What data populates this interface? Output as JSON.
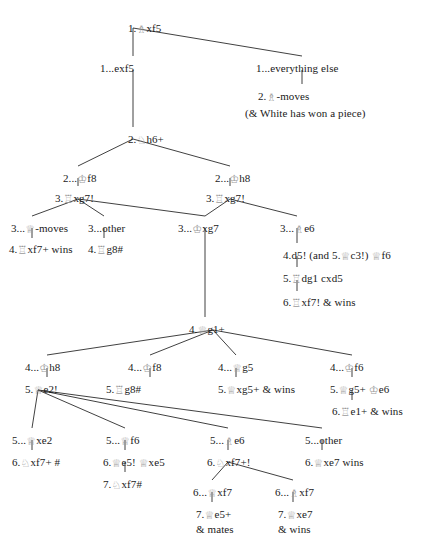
{
  "figure": {
    "type": "chess-variation-tree",
    "piece_glyph_color": "#9a9a9a",
    "line_color": "#2b2b2b",
    "background": "#ffffff"
  },
  "nodes": [
    {
      "id": "n1",
      "x": 128,
      "y": 22,
      "align": "left",
      "text": "1.♗xf5"
    },
    {
      "id": "n2",
      "x": 100,
      "y": 62,
      "align": "left",
      "text": "1...exf5"
    },
    {
      "id": "n3",
      "x": 256,
      "y": 62,
      "align": "left",
      "text": "1...everything else"
    },
    {
      "id": "n4",
      "x": 258,
      "y": 90,
      "align": "left",
      "text": "2.♗-moves"
    },
    {
      "id": "n5",
      "x": 245,
      "y": 107,
      "align": "left",
      "text": "(& White has won a piece)"
    },
    {
      "id": "n6",
      "x": 128,
      "y": 133,
      "align": "left",
      "text": "2.♘h6+"
    },
    {
      "id": "n7",
      "x": 63,
      "y": 172,
      "align": "left",
      "text": "2...♔f8"
    },
    {
      "id": "n8",
      "x": 215,
      "y": 172,
      "align": "left",
      "text": "2...♔h8"
    },
    {
      "id": "n9",
      "x": 55,
      "y": 192,
      "align": "left",
      "text": "3.♖xg7!"
    },
    {
      "id": "n10",
      "x": 206,
      "y": 192,
      "align": "left",
      "text": "3.♖xg7!"
    },
    {
      "id": "n11",
      "x": 11,
      "y": 222,
      "align": "left",
      "text": "3...♕-moves"
    },
    {
      "id": "n12",
      "x": 88,
      "y": 222,
      "align": "left",
      "text": "3...other"
    },
    {
      "id": "n13",
      "x": 178,
      "y": 222,
      "align": "left",
      "text": "3...♔xg7"
    },
    {
      "id": "n14",
      "x": 280,
      "y": 222,
      "align": "left",
      "text": "3...♗e6"
    },
    {
      "id": "n15",
      "x": 9,
      "y": 243,
      "align": "left",
      "text": "4.♖xf7+ wins"
    },
    {
      "id": "n16",
      "x": 88,
      "y": 243,
      "align": "left",
      "text": "4.♖g8#"
    },
    {
      "id": "n17",
      "x": 283,
      "y": 249,
      "align": "left",
      "text": "4.d5! (and 5.♕c3!) ♕f6"
    },
    {
      "id": "n18",
      "x": 283,
      "y": 272,
      "align": "left",
      "text": "5.♖dg1 cxd5"
    },
    {
      "id": "n19",
      "x": 283,
      "y": 296,
      "align": "left",
      "text": "6.♖xf7! & wins"
    },
    {
      "id": "n20",
      "x": 189,
      "y": 323,
      "align": "left",
      "text": "4.♕g1+"
    },
    {
      "id": "n21",
      "x": 25,
      "y": 361,
      "align": "left",
      "text": "4...♔h8"
    },
    {
      "id": "n22",
      "x": 128,
      "y": 361,
      "align": "left",
      "text": "4...♔f8"
    },
    {
      "id": "n23",
      "x": 218,
      "y": 361,
      "align": "left",
      "text": "4...♕g5"
    },
    {
      "id": "n24",
      "x": 330,
      "y": 361,
      "align": "left",
      "text": "4...♔f6"
    },
    {
      "id": "n25",
      "x": 25,
      "y": 383,
      "align": "left",
      "text": "5.♕e2!"
    },
    {
      "id": "n26",
      "x": 106,
      "y": 383,
      "align": "left",
      "text": "5.♖g8#"
    },
    {
      "id": "n27",
      "x": 218,
      "y": 383,
      "align": "left",
      "text": "5.♕xg5+ & wins"
    },
    {
      "id": "n28",
      "x": 330,
      "y": 383,
      "align": "left",
      "text": "5.♕g5+ ♔e6"
    },
    {
      "id": "n29",
      "x": 332,
      "y": 405,
      "align": "left",
      "text": "6.♖e1+ & wins"
    },
    {
      "id": "n30",
      "x": 12,
      "y": 434,
      "align": "left",
      "text": "5...♕xe2"
    },
    {
      "id": "n31",
      "x": 106,
      "y": 434,
      "align": "left",
      "text": "5...♕f6"
    },
    {
      "id": "n32",
      "x": 210,
      "y": 434,
      "align": "left",
      "text": "5...♗e6"
    },
    {
      "id": "n33",
      "x": 305,
      "y": 434,
      "align": "left",
      "text": "5...other"
    },
    {
      "id": "n34",
      "x": 12,
      "y": 456,
      "align": "left",
      "text": "6.♘xf7+ #"
    },
    {
      "id": "n35",
      "x": 103,
      "y": 456,
      "align": "left",
      "text": "6.♕e5! ♕xe5"
    },
    {
      "id": "n36",
      "x": 207,
      "y": 456,
      "align": "left",
      "text": "6.♘xf7+!"
    },
    {
      "id": "n37",
      "x": 305,
      "y": 456,
      "align": "left",
      "text": "6.♕xe7 wins"
    },
    {
      "id": "n38",
      "x": 103,
      "y": 478,
      "align": "left",
      "text": "7.♘xf7#"
    },
    {
      "id": "n39",
      "x": 193,
      "y": 486,
      "align": "left",
      "text": "6...♕xf7"
    },
    {
      "id": "n40",
      "x": 275,
      "y": 486,
      "align": "left",
      "text": "6...♗xf7"
    },
    {
      "id": "n41",
      "x": 196,
      "y": 508,
      "align": "left",
      "text": "7.♕e5+"
    },
    {
      "id": "n42",
      "x": 196,
      "y": 523,
      "align": "left",
      "text": "& mates"
    },
    {
      "id": "n43",
      "x": 278,
      "y": 508,
      "align": "left",
      "text": "7.♕xe7"
    },
    {
      "id": "n44",
      "x": 278,
      "y": 523,
      "align": "left",
      "text": "& wins"
    }
  ],
  "edges": [
    {
      "from": "1.♗xf5",
      "to": "1...exf5",
      "x1": 133,
      "y1": 28,
      "x2": 133,
      "y2": 56
    },
    {
      "from": "1.♗xf5",
      "to": "1...everything else",
      "x1": 133,
      "y1": 28,
      "x2": 302,
      "y2": 56
    },
    {
      "from": "1...everything else",
      "to": "2.♗-moves",
      "x1": 302,
      "y1": 70,
      "x2": 302,
      "y2": 84
    },
    {
      "from": "1...exf5",
      "to": "2.♘h6+",
      "x1": 133,
      "y1": 70,
      "x2": 133,
      "y2": 127
    },
    {
      "from": "2.♘h6+",
      "to": "2...♔f8",
      "x1": 133,
      "y1": 139,
      "x2": 78,
      "y2": 166
    },
    {
      "from": "2.♘h6+",
      "to": "2...♔h8",
      "x1": 133,
      "y1": 139,
      "x2": 230,
      "y2": 166
    },
    {
      "from": "2...♔f8",
      "to": "3.♖xg7! (left)",
      "x1": 78,
      "y1": 178,
      "x2": 78,
      "y2": 186
    },
    {
      "from": "2...♔h8",
      "to": "3.♖xg7! (right)",
      "x1": 230,
      "y1": 178,
      "x2": 230,
      "y2": 186
    },
    {
      "from": "3.♖xg7! (left)",
      "to": "3...♕-moves",
      "x1": 78,
      "y1": 199,
      "x2": 32,
      "y2": 216
    },
    {
      "from": "3.♖xg7! (left)",
      "to": "3...other",
      "x1": 78,
      "y1": 199,
      "x2": 104,
      "y2": 216
    },
    {
      "from": "3.♖xg7! (left)",
      "to": "3...♔xg7",
      "x1": 78,
      "y1": 199,
      "x2": 205,
      "y2": 216
    },
    {
      "from": "3.♖xg7! (right)",
      "to": "3...♔xg7",
      "x1": 230,
      "y1": 199,
      "x2": 205,
      "y2": 216
    },
    {
      "from": "3.♖xg7! (right)",
      "to": "3...♗e6",
      "x1": 230,
      "y1": 199,
      "x2": 297,
      "y2": 216
    },
    {
      "from": "3...♕-moves",
      "to": "4.♖xf7+ wins",
      "x1": 32,
      "y1": 228,
      "x2": 32,
      "y2": 238
    },
    {
      "from": "3...other",
      "to": "4.♖g8#",
      "x1": 104,
      "y1": 228,
      "x2": 104,
      "y2": 238
    },
    {
      "from": "3...♗e6",
      "to": "4.d5!",
      "x1": 297,
      "y1": 228,
      "x2": 297,
      "y2": 243
    },
    {
      "from": "4.d5!",
      "to": "5.♖dg1 cxd5",
      "x1": 297,
      "y1": 256,
      "x2": 297,
      "y2": 267
    },
    {
      "from": "5.♖dg1 cxd5",
      "to": "6.♖xf7! & wins",
      "x1": 297,
      "y1": 280,
      "x2": 297,
      "y2": 291
    },
    {
      "from": "3...♔xg7",
      "to": "4.♕g1+",
      "x1": 205,
      "y1": 228,
      "x2": 205,
      "y2": 317
    },
    {
      "from": "4.♕g1+",
      "to": "4...♔h8",
      "x1": 213,
      "y1": 330,
      "x2": 47,
      "y2": 355
    },
    {
      "from": "4.♕g1+",
      "to": "4...♔f8",
      "x1": 213,
      "y1": 330,
      "x2": 150,
      "y2": 355
    },
    {
      "from": "4.♕g1+",
      "to": "4...♕g5",
      "x1": 213,
      "y1": 330,
      "x2": 236,
      "y2": 355
    },
    {
      "from": "4.♕g1+",
      "to": "4...♔f6",
      "x1": 213,
      "y1": 330,
      "x2": 352,
      "y2": 355
    },
    {
      "from": "4...♔h8",
      "to": "5.♕e2!",
      "x1": 47,
      "y1": 368,
      "x2": 47,
      "y2": 377
    },
    {
      "from": "4...♔f8",
      "to": "5.♖g8#",
      "x1": 150,
      "y1": 368,
      "x2": 150,
      "y2": 377
    },
    {
      "from": "4...♕g5",
      "to": "5.♕xg5+ & wins",
      "x1": 236,
      "y1": 368,
      "x2": 236,
      "y2": 377
    },
    {
      "from": "4...♔f6",
      "to": "5.♕g5+ ♔e6",
      "x1": 352,
      "y1": 368,
      "x2": 352,
      "y2": 377
    },
    {
      "from": "5.♕g5+ ♔e6",
      "to": "6.♖e1+ & wins",
      "x1": 352,
      "y1": 390,
      "x2": 352,
      "y2": 400
    },
    {
      "from": "5.♕e2!",
      "to": "5...♕xe2",
      "x1": 38,
      "y1": 390,
      "x2": 32,
      "y2": 428
    },
    {
      "from": "5.♕e2!",
      "to": "5...♕f6",
      "x1": 38,
      "y1": 390,
      "x2": 125,
      "y2": 428
    },
    {
      "from": "5.♕e2!",
      "to": "5...♗e6",
      "x1": 38,
      "y1": 390,
      "x2": 228,
      "y2": 428
    },
    {
      "from": "5.♕e2!",
      "to": "5...other",
      "x1": 38,
      "y1": 390,
      "x2": 322,
      "y2": 428
    },
    {
      "from": "5...♕xe2",
      "to": "6.♘xf7+ #",
      "x1": 32,
      "y1": 440,
      "x2": 32,
      "y2": 450
    },
    {
      "from": "5...♕f6",
      "to": "6.♕e5! ♕xe5",
      "x1": 125,
      "y1": 440,
      "x2": 125,
      "y2": 450
    },
    {
      "from": "5...♗e6",
      "to": "6.♘xf7+!",
      "x1": 228,
      "y1": 440,
      "x2": 228,
      "y2": 450
    },
    {
      "from": "5...other",
      "to": "6.♕xe7 wins",
      "x1": 322,
      "y1": 440,
      "x2": 322,
      "y2": 450
    },
    {
      "from": "6.♕e5! ♕xe5",
      "to": "7.♘xf7#",
      "x1": 125,
      "y1": 462,
      "x2": 125,
      "y2": 472
    },
    {
      "from": "6.♘xf7+!",
      "to": "6...♕xf7",
      "x1": 228,
      "y1": 462,
      "x2": 212,
      "y2": 480
    },
    {
      "from": "6.♘xf7+!",
      "to": "6...♗xf7",
      "x1": 228,
      "y1": 462,
      "x2": 293,
      "y2": 480
    },
    {
      "from": "6...♕xf7",
      "to": "7.♕e5+",
      "x1": 212,
      "y1": 492,
      "x2": 212,
      "y2": 502
    },
    {
      "from": "6...♗xf7",
      "to": "7.♕xe7",
      "x1": 293,
      "y1": 492,
      "x2": 293,
      "y2": 502
    }
  ]
}
